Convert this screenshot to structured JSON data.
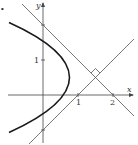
{
  "diagram": {
    "bullet": "•",
    "axes": {
      "x_label": "x",
      "y_label": "y",
      "x_ticks": [
        "1",
        "2"
      ],
      "y_ticks": [
        "1"
      ]
    },
    "curve": "x = 1 + y - y^2",
    "tangent_lines": [
      "y = x - 1",
      "y = 2 - x"
    ],
    "intersection": [
      1.5,
      0.5
    ],
    "right_angle_marker": true,
    "colors": {
      "curve": "#1a1a1a",
      "lines": "#555555",
      "axes": "#444444"
    }
  }
}
